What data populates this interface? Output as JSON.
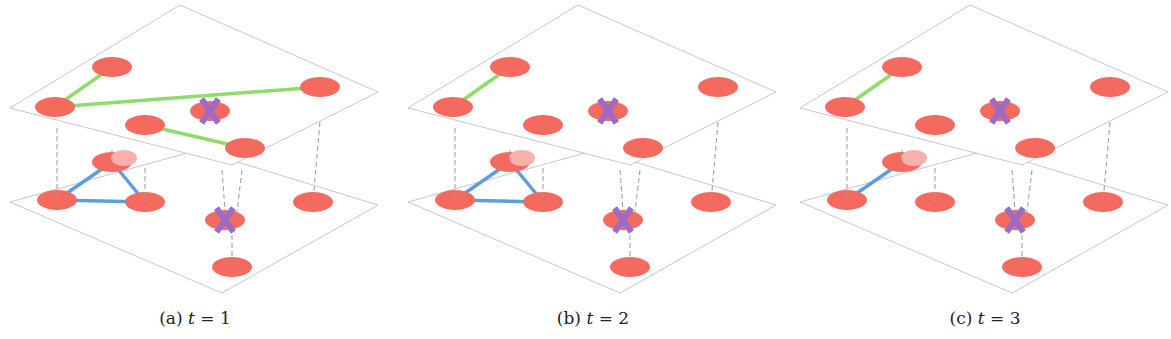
{
  "figure": {
    "colors": {
      "node": "#f46a5f",
      "node_ghost": "#f6b1ab",
      "intra_top_edge": "#8fdc6a",
      "intra_bottom_edge": "#5d9de0",
      "removed_marker": "#9b6bc6",
      "plane_outline": "#c8c8c8",
      "interlayer_link": "#9a9a9a"
    },
    "planes": {
      "top": [
        [
          180,
          5
        ],
        [
          378,
          92
        ],
        [
          232,
          165
        ],
        [
          10,
          108
        ]
      ],
      "bottom": [
        [
          198,
          150
        ],
        [
          378,
          205
        ],
        [
          222,
          293
        ],
        [
          10,
          202
        ]
      ]
    },
    "top_nodes": [
      {
        "id": "u1",
        "x": 112,
        "y": 67
      },
      {
        "id": "u2",
        "x": 55,
        "y": 107
      },
      {
        "id": "u3",
        "x": 320,
        "y": 87
      },
      {
        "id": "u4",
        "x": 210,
        "y": 111,
        "removed": true
      },
      {
        "id": "u5",
        "x": 145,
        "y": 125
      },
      {
        "id": "u6",
        "x": 245,
        "y": 148
      }
    ],
    "bottom_nodes": [
      {
        "id": "v1",
        "x": 112,
        "y": 162
      },
      {
        "id": "v2",
        "x": 57,
        "y": 200
      },
      {
        "id": "v3",
        "x": 145,
        "y": 202
      },
      {
        "id": "v4",
        "x": 225,
        "y": 220,
        "removed": true
      },
      {
        "id": "v5",
        "x": 313,
        "y": 202
      },
      {
        "id": "v6",
        "x": 232,
        "y": 267
      }
    ],
    "interlayer_links": [
      [
        "u2",
        "v2"
      ],
      [
        "u3",
        "v5"
      ],
      [
        "u6",
        "v4"
      ],
      [
        "u6",
        "v4b"
      ],
      [
        "u4",
        "v6"
      ],
      [
        "ghost",
        "v3"
      ]
    ],
    "panels": [
      {
        "id": "a",
        "caption_prefix": "(a)",
        "caption_var": "t",
        "caption_eq": " = 1",
        "offset_x": 0,
        "top_edges": [
          [
            "u1",
            "u2"
          ],
          [
            "u2",
            "u3"
          ],
          [
            "u5",
            "u6"
          ]
        ],
        "bottom_edges": [
          [
            "v1",
            "v2"
          ],
          [
            "v2",
            "v3"
          ],
          [
            "v1",
            "v3"
          ]
        ]
      },
      {
        "id": "b",
        "caption_prefix": "(b)",
        "caption_var": "t",
        "caption_eq": " = 2",
        "offset_x": 398,
        "top_edges": [
          [
            "u1",
            "u2"
          ]
        ],
        "bottom_edges": [
          [
            "v1",
            "v2"
          ],
          [
            "v2",
            "v3"
          ],
          [
            "v1",
            "v3"
          ]
        ]
      },
      {
        "id": "c",
        "caption_prefix": "(c)",
        "caption_var": "t",
        "caption_eq": " = 3",
        "offset_x": 790,
        "top_edges": [
          [
            "u1",
            "u2"
          ]
        ],
        "bottom_edges": [
          [
            "v1",
            "v2"
          ]
        ]
      }
    ]
  }
}
